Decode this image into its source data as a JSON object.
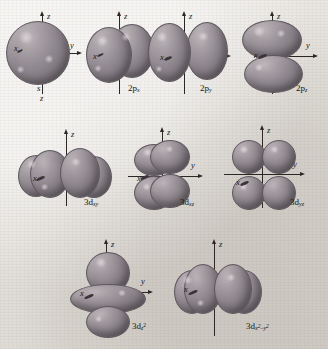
{
  "figure": {
    "background_color": "#e9e6e2",
    "orbital_color": "#8e868d",
    "axis_color": "#2a2724"
  },
  "axis_labels": {
    "x": "x",
    "y": "y",
    "z": "z"
  },
  "rows": [
    {
      "row_index": 1,
      "orbitals": [
        {
          "id": "s",
          "label_base": "",
          "label_sub": "",
          "label_sup": "",
          "full_label": "s",
          "shape": "sphere",
          "axes": [
            "z",
            "y",
            "x"
          ],
          "axis_z_bottom_label": "z"
        },
        {
          "id": "2px",
          "label_base": "2p",
          "label_sub": "x",
          "label_sup": "",
          "full_label": "2p_x",
          "shape": "dumbbell-x",
          "axes": [
            "z",
            "y",
            "x"
          ]
        },
        {
          "id": "2py",
          "label_base": "2p",
          "label_sub": "y",
          "label_sup": "",
          "full_label": "2p_y",
          "shape": "dumbbell-y",
          "axes": [
            "z",
            "y",
            "x"
          ]
        },
        {
          "id": "2pz",
          "label_base": "2p",
          "label_sub": "z",
          "label_sup": "",
          "full_label": "2p_z",
          "shape": "dumbbell-z",
          "axes": [
            "z",
            "y",
            "x"
          ]
        }
      ]
    },
    {
      "row_index": 2,
      "orbitals": [
        {
          "id": "3dxy",
          "label_base": "3d",
          "label_sub": "xy",
          "label_sup": "",
          "full_label": "3d_xy",
          "shape": "cloverleaf-xy",
          "axes": [
            "z",
            "y",
            "x"
          ]
        },
        {
          "id": "3dxz",
          "label_base": "3d",
          "label_sub": "xz",
          "label_sup": "",
          "full_label": "3d_xz",
          "shape": "cloverleaf-xz",
          "axes": [
            "z",
            "y",
            "x"
          ]
        },
        {
          "id": "3dyz",
          "label_base": "3d",
          "label_sub": "yz",
          "label_sup": "",
          "full_label": "3d_yz",
          "shape": "cloverleaf-yz",
          "axes": [
            "z",
            "y",
            "x"
          ]
        }
      ]
    },
    {
      "row_index": 3,
      "orbitals": [
        {
          "id": "3dz2",
          "label_base": "3d",
          "label_sub": "z",
          "label_sup": "2",
          "full_label": "3d_z2",
          "shape": "donut-dumbbell",
          "axes": [
            "z",
            "y",
            "x"
          ]
        },
        {
          "id": "3dx2y2",
          "label_base": "3d",
          "label_sub": "x2-y2",
          "label_sup": "",
          "full_label": "3d_x2-y2",
          "shape": "cloverleaf-axial",
          "axes": [
            "z",
            "y",
            "x"
          ]
        }
      ]
    }
  ]
}
